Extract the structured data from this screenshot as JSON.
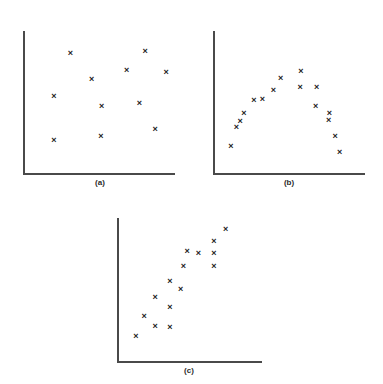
{
  "figure": {
    "background_color": "#ffffff",
    "axis_color": "#4a4a4a",
    "marker_color": "#1c1c1c",
    "marker_glyph": "×"
  },
  "chart_data": [
    {
      "type": "scatter",
      "title": "(a)",
      "label": "(a)",
      "xlabel": "",
      "ylabel": "",
      "grid": false,
      "legend": "none",
      "xlim": [
        0,
        100
      ],
      "ylim": [
        0,
        100
      ],
      "annotation": "no correlation / random scatter",
      "points": [
        {
          "x": 29.6,
          "y": 86.8
        },
        {
          "x": 82.9,
          "y": 88.9
        },
        {
          "x": 69.7,
          "y": 73.6
        },
        {
          "x": 44.7,
          "y": 66.7
        },
        {
          "x": 98.0,
          "y": 72.2
        },
        {
          "x": 17.8,
          "y": 53.5
        },
        {
          "x": 51.9,
          "y": 45.8
        },
        {
          "x": 78.9,
          "y": 47.9
        },
        {
          "x": 90.1,
          "y": 27.8
        },
        {
          "x": 51.3,
          "y": 22.2
        },
        {
          "x": 17.8,
          "y": 18.8
        }
      ]
    },
    {
      "type": "scatter",
      "title": "(b)",
      "label": "(b)",
      "xlabel": "",
      "ylabel": "",
      "grid": false,
      "legend": "none",
      "xlim": [
        0,
        100
      ],
      "ylim": [
        0,
        100
      ],
      "annotation": "non-linear / inverted-U relationship",
      "points": [
        {
          "x": 8.6,
          "y": 14.6
        },
        {
          "x": 12.5,
          "y": 29.2
        },
        {
          "x": 15.1,
          "y": 34.0
        },
        {
          "x": 17.8,
          "y": 40.3
        },
        {
          "x": 25.0,
          "y": 50.7
        },
        {
          "x": 30.9,
          "y": 51.4
        },
        {
          "x": 38.8,
          "y": 58.3
        },
        {
          "x": 44.1,
          "y": 67.4
        },
        {
          "x": 58.6,
          "y": 72.9
        },
        {
          "x": 57.9,
          "y": 60.4
        },
        {
          "x": 69.7,
          "y": 60.4
        },
        {
          "x": 69.1,
          "y": 45.8
        },
        {
          "x": 78.9,
          "y": 40.3
        },
        {
          "x": 78.3,
          "y": 34.7
        },
        {
          "x": 82.9,
          "y": 22.2
        },
        {
          "x": 86.2,
          "y": 9.7
        }
      ]
    },
    {
      "type": "scatter",
      "title": "(c)",
      "label": "(c)",
      "xlabel": "",
      "ylabel": "",
      "grid": false,
      "legend": "none",
      "xlim": [
        0,
        100
      ],
      "ylim": [
        0,
        100
      ],
      "annotation": "strong positive linear correlation",
      "points": [
        {
          "x": 9.7,
          "y": 13.1
        },
        {
          "x": 15.9,
          "y": 28.3
        },
        {
          "x": 24.1,
          "y": 20.7
        },
        {
          "x": 24.1,
          "y": 42.8
        },
        {
          "x": 35.2,
          "y": 20.0
        },
        {
          "x": 35.2,
          "y": 35.2
        },
        {
          "x": 35.2,
          "y": 55.2
        },
        {
          "x": 43.4,
          "y": 49.0
        },
        {
          "x": 45.5,
          "y": 66.9
        },
        {
          "x": 48.3,
          "y": 78.6
        },
        {
          "x": 56.6,
          "y": 77.2
        },
        {
          "x": 68.3,
          "y": 66.9
        },
        {
          "x": 68.3,
          "y": 77.2
        },
        {
          "x": 68.3,
          "y": 86.2
        },
        {
          "x": 77.2,
          "y": 95.9
        }
      ]
    }
  ]
}
